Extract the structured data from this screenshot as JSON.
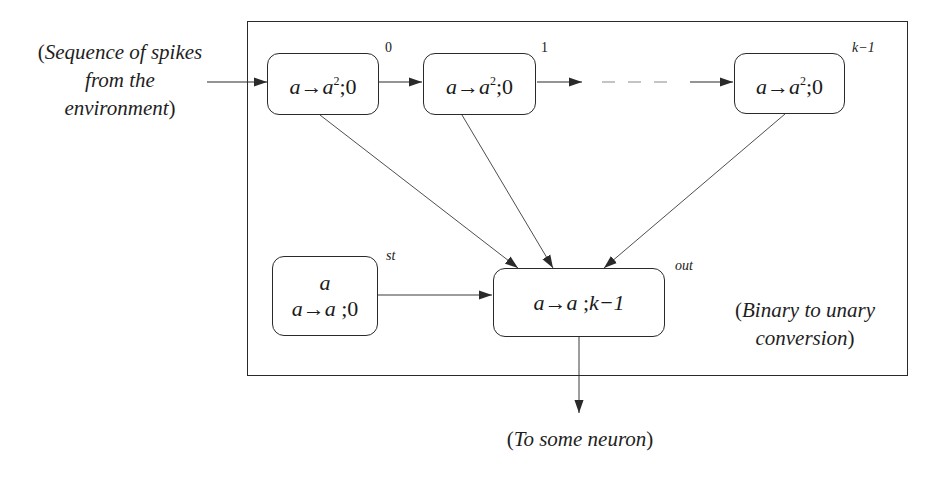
{
  "diagram": {
    "type": "spiking-neural-p-system-module",
    "colors": {
      "stroke": "#2a2a2a",
      "text": "#1a1a1a",
      "background": "#ffffff"
    },
    "frame": {
      "annotation": {
        "open": "(",
        "line1": "Binary to unary",
        "line2": "conversion",
        "close": ")"
      }
    },
    "input_annotation": {
      "open": "(",
      "line1": "Sequence of spikes",
      "line2": "from the",
      "line3": "environment",
      "close": ")"
    },
    "output_annotation": {
      "open": "(",
      "text": "To some neuron",
      "close": ")"
    },
    "neurons": [
      {
        "id": "0",
        "label": "0",
        "label_italic": false,
        "rule": {
          "lhs": "a",
          "arrow": "→",
          "rhs": "a",
          "rhs_exp": "2",
          "sep": ";",
          "delay": "0"
        }
      },
      {
        "id": "1",
        "label": "1",
        "label_italic": false,
        "rule": {
          "lhs": "a",
          "arrow": "→",
          "rhs": "a",
          "rhs_exp": "2",
          "sep": ";",
          "delay": "0"
        }
      },
      {
        "id": "k-1",
        "label": "k−1",
        "label_italic": false,
        "rule": {
          "lhs": "a",
          "arrow": "→",
          "rhs": "a",
          "rhs_exp": "2",
          "sep": ";",
          "delay": "0"
        }
      },
      {
        "id": "st",
        "label": "st",
        "label_italic": true,
        "initial_spikes": "a",
        "rule": {
          "lhs": "a",
          "arrow": "→",
          "rhs": "a",
          "sep": ";",
          "delay": "0"
        }
      },
      {
        "id": "out",
        "label": "out",
        "label_italic": true,
        "rule": {
          "lhs": "a",
          "arrow": "→",
          "rhs": "a",
          "sep": ";",
          "delay": "k−1"
        }
      }
    ],
    "edges": [
      {
        "from": "environment",
        "to": "0",
        "style": "solid"
      },
      {
        "from": "0",
        "to": "1",
        "style": "solid"
      },
      {
        "from": "1",
        "to": "k-1",
        "style": "dashed-chain"
      },
      {
        "from": "0",
        "to": "out",
        "style": "solid"
      },
      {
        "from": "1",
        "to": "out",
        "style": "solid"
      },
      {
        "from": "k-1",
        "to": "out",
        "style": "solid"
      },
      {
        "from": "st",
        "to": "out",
        "style": "solid"
      },
      {
        "from": "out",
        "to": "environment",
        "style": "solid"
      }
    ]
  }
}
